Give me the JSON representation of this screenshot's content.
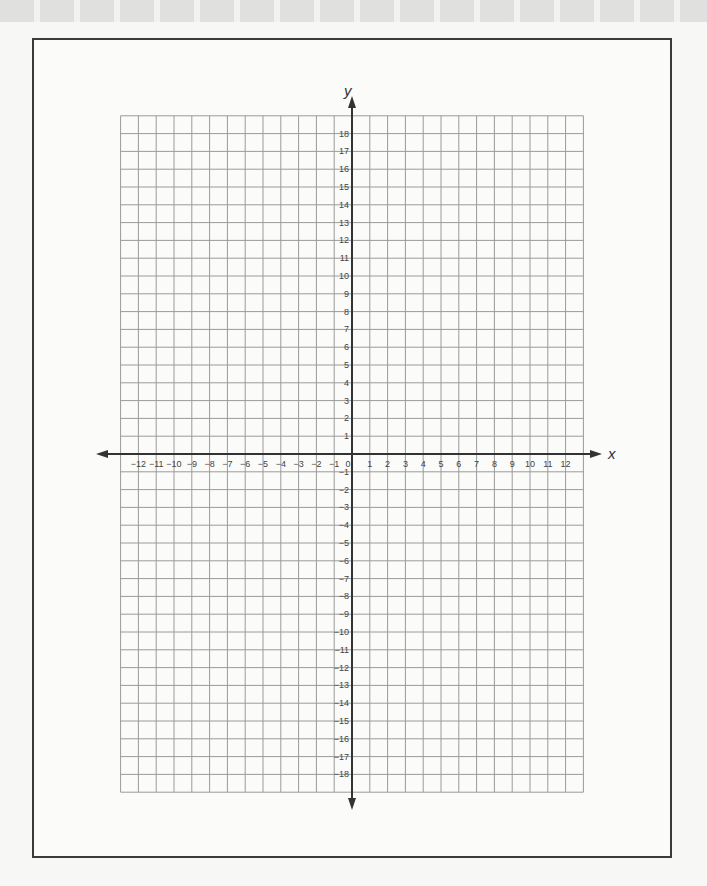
{
  "chart_data": {
    "type": "coordinate-grid",
    "title": "",
    "xlabel": "x",
    "ylabel": "y",
    "x_range": [
      -13,
      13
    ],
    "y_range": [
      -19,
      19
    ],
    "grid": true,
    "x_tick_labels": [
      "-12",
      "-11",
      "-10",
      "-9",
      "-8",
      "-7",
      "-6",
      "-5",
      "-4",
      "-3",
      "-2",
      "-1",
      "0",
      "1",
      "2",
      "3",
      "4",
      "5",
      "6",
      "7",
      "8",
      "9",
      "10",
      "11",
      "12"
    ],
    "y_tick_labels": [
      "18",
      "17",
      "16",
      "15",
      "14",
      "13",
      "12",
      "11",
      "10",
      "9",
      "8",
      "7",
      "6",
      "5",
      "4",
      "3",
      "2",
      "1",
      "-1",
      "-2",
      "-3",
      "-4",
      "-5",
      "-6",
      "-7",
      "-8",
      "-9",
      "-10",
      "-11",
      "-12",
      "-13",
      "-14",
      "-15",
      "-16",
      "-17",
      "-18"
    ],
    "colors": {
      "grid": "#9a9a9a",
      "axis": "#333333",
      "frame": "#3a3a3a"
    }
  },
  "axes": {
    "x_name": "x",
    "y_name": "y"
  }
}
